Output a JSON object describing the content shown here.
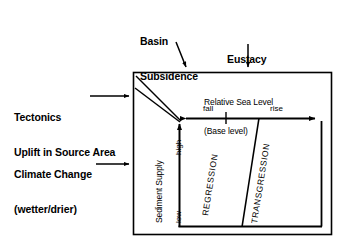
{
  "diagram": {
    "external_inputs": [
      {
        "id": "basin-subsidence",
        "line1": "Basin",
        "line2": "Subsidence"
      },
      {
        "id": "eustacy",
        "line1": "Eustacy",
        "line2": ""
      },
      {
        "id": "tectonics",
        "line1": "Tectonics",
        "line2": "Uplift in Source Area"
      },
      {
        "id": "climate-change",
        "line1": "Climate Change",
        "line2": "(wetter/drier)"
      }
    ],
    "box": {
      "header_line1": "Relative Sea Level",
      "header_line2": "(Base level)"
    },
    "x_axis": {
      "name": "Relative Sea Level",
      "left_label": "fall",
      "right_label": "rise",
      "arrow": "double"
    },
    "y_axis": {
      "name": "Sediment Supply",
      "top_label": "high",
      "bottom_label": "low",
      "arrow": "up"
    },
    "zones": [
      {
        "id": "regression",
        "label": "REGRESSION"
      },
      {
        "id": "transgression",
        "label": "TRANSGRESSION"
      }
    ],
    "colors": {
      "stroke": "#000000",
      "background": "#ffffff",
      "text": "#000000"
    }
  }
}
